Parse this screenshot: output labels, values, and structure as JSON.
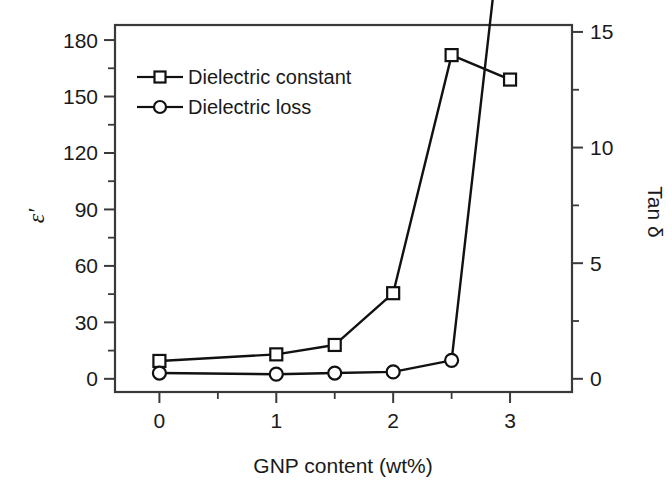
{
  "chart_data": {
    "type": "line",
    "title": "",
    "xlabel": "GNP content (wt%)",
    "ylabel": "ε′",
    "ylabel_right": "Tan δ",
    "x": [
      0,
      1,
      1.5,
      2,
      2.5,
      3
    ],
    "xlim": [
      -0.38,
      3.53
    ],
    "xticks": [
      0,
      1,
      2,
      3
    ],
    "xtick_labels": [
      "0",
      "1",
      "2",
      "3"
    ],
    "xticks_minor": [
      0.5,
      1.5,
      2.5
    ],
    "ylim": [
      -7,
      188
    ],
    "yticks": [
      0,
      30,
      60,
      90,
      120,
      150,
      180
    ],
    "ytick_labels": [
      "0",
      "30",
      "60",
      "90",
      "120",
      "150",
      "180"
    ],
    "yticks_minor": [
      15,
      45,
      75,
      105,
      135,
      165
    ],
    "ylim_right": [
      -0.57,
      15.3
    ],
    "yticks_right": [
      0,
      5,
      10,
      15,
      20,
      25
    ],
    "ytick_right_labels": [
      "0",
      "5",
      "10",
      "15",
      "20",
      "25"
    ],
    "yticks_right_minor": [
      2.5,
      7.5,
      12.5,
      17.5,
      22.5,
      27.5
    ],
    "grid": false,
    "legend_position": "upper left",
    "series": [
      {
        "name": "Dielectric constant",
        "axis": "left",
        "marker": "square",
        "values": [
          9.5,
          13,
          18,
          45.5,
          172,
          159
        ]
      },
      {
        "name": "Dielectric loss",
        "axis": "right",
        "marker": "circle",
        "values": [
          0.25,
          0.2,
          0.25,
          0.3,
          0.8,
          23.0
        ]
      }
    ]
  },
  "legend": {
    "items": [
      {
        "label": "Dielectric constant",
        "marker": "square"
      },
      {
        "label": "Dielectric loss",
        "marker": "circle"
      }
    ]
  }
}
